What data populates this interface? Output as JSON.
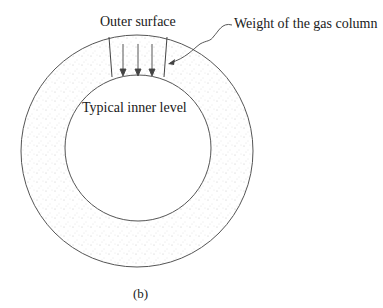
{
  "figure": {
    "labels": {
      "outer_surface": "Outer surface",
      "weight_column": "Weight of the gas column",
      "inner_level": "Typical inner level",
      "caption": "(b)"
    },
    "colors": {
      "stroke": "#444444",
      "stipple": "#b8b8b8",
      "text": "#1a1a1a"
    }
  }
}
